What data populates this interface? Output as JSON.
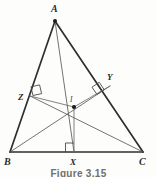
{
  "figure": {
    "caption": "Figure 3.15",
    "colors": {
      "triangle_stroke": "#2f2f2f",
      "cevian_stroke": "#5a5a5a",
      "inradius_stroke": "#6a6a6a",
      "right_angle_stroke": "#4a4a4a",
      "point_fill": "#1b1b1b",
      "label_color": "#2b2b2b",
      "caption_color": "#6f6f6f",
      "background": "#fdfdfc"
    },
    "vertices": {
      "A": {
        "label": "A",
        "x": 55,
        "y": 21,
        "label_x": 51,
        "label_y": 12
      },
      "B": {
        "label": "B",
        "x": 10,
        "y": 152,
        "label_x": 4,
        "label_y": 165
      },
      "C": {
        "label": "C",
        "x": 143,
        "y": 152,
        "label_x": 140,
        "label_y": 165
      }
    },
    "incenter": {
      "label": "I",
      "x": 74,
      "y": 107,
      "label_x": 70,
      "label_y": 101,
      "dot_radius": 2.1
    },
    "touch_points": {
      "X": {
        "label": "X",
        "x": 74,
        "y": 152,
        "label_x": 70,
        "label_y": 165,
        "side": "BC"
      },
      "Y": {
        "label": "Y",
        "x": 110,
        "y": 86,
        "label_x": 109,
        "label_y": 80,
        "side": "AC"
      },
      "Z": {
        "label": "Z",
        "x": 30,
        "y": 96,
        "label_x": 19,
        "label_y": 100,
        "side": "AB"
      }
    },
    "right_angle_marks": [
      {
        "at": "X",
        "name": "right-angle-mark-x"
      },
      {
        "at": "Y",
        "name": "right-angle-mark-y"
      },
      {
        "at": "Z",
        "name": "right-angle-mark-z"
      }
    ],
    "segments": [
      {
        "name": "side-AB",
        "from": "A",
        "to": "B"
      },
      {
        "name": "side-BC",
        "from": "B",
        "to": "C"
      },
      {
        "name": "side-CA",
        "from": "C",
        "to": "A"
      },
      {
        "name": "cevian-A-to-X",
        "from": "A",
        "to": "X"
      },
      {
        "name": "cevian-B-to-Y",
        "from": "B",
        "to": "Y"
      },
      {
        "name": "cevian-C-to-Z",
        "from": "C",
        "to": "Z"
      }
    ]
  }
}
